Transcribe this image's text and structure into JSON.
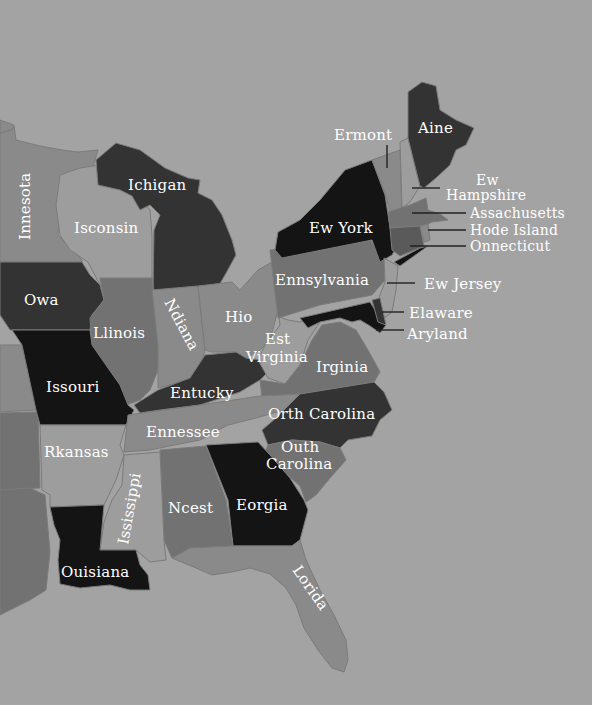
{
  "map": {
    "background_color": "#a3a3a3",
    "shades": {
      "black": "#141414",
      "dark": "#333333",
      "mid_dark": "#5a5a5a",
      "mid": "#727272",
      "light": "#8a8a8a",
      "lighter": "#9d9d9d"
    },
    "labels": {
      "minnesota": "Innesota",
      "wisconsin": "Isconsin",
      "michigan": "Ichigan",
      "iowa": "Owa",
      "illinois": "Llinois",
      "indiana": "Ndiana",
      "ohio": "Hio",
      "missouri": "Issouri",
      "kentucky": "Entucky",
      "tennessee": "Ennessee",
      "arkansas": "Rkansas",
      "mississippi": "Ississippi",
      "alabama": "Ncest",
      "georgia": "Eorgia",
      "louisiana": "Ouisiana",
      "florida": "Lorida",
      "south_carolina_1": "Outh",
      "south_carolina_2": "Carolina",
      "north_carolina": "Orth Carolina",
      "virginia": "Irginia",
      "west_virginia_1": "Est",
      "west_virginia_2": "Virginia",
      "pennsylvania": "Ennsylvania",
      "new_york": "Ew York",
      "vermont": "Ermont",
      "maine": "Aine",
      "new_hampshire_1": "Ew",
      "new_hampshire_2": "Hampshire",
      "massachusetts": "Assachusetts",
      "rhode_island": "Hode Island",
      "connecticut": "Onnecticut",
      "new_jersey": "Ew Jersey",
      "delaware": "Elaware",
      "maryland": "Aryland"
    }
  }
}
